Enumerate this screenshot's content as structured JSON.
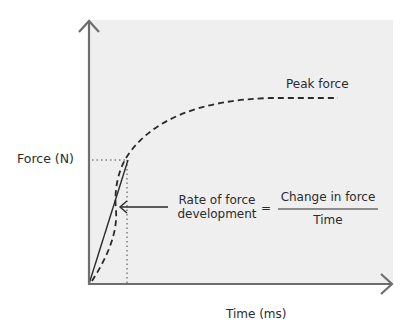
{
  "diagram": {
    "y_axis_label": "Force (N)",
    "x_axis_label": "Time (ms)",
    "curve_label": "Peak force",
    "annotation": {
      "lhs_line1": "Rate of force",
      "lhs_line2": "development",
      "equals": "=",
      "numerator": "Change in force",
      "denominator": "Time"
    },
    "colors": {
      "plot_background": "#efefef",
      "axis": "#6e6e6e",
      "curve": "#2a2a2a"
    }
  }
}
